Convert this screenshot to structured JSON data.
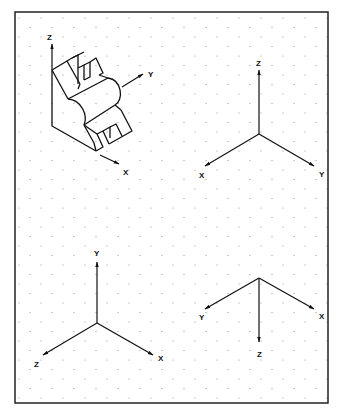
{
  "figure": {
    "frame": {
      "x": 15,
      "y": 12,
      "width": 313,
      "height": 391,
      "stroke": "#222222"
    },
    "grid": {
      "type": "isometric-dot",
      "dx": 11,
      "dy": 19,
      "color": "#888888"
    },
    "panels": [
      {
        "id": "object-view",
        "description": "Isometric sketch of bracket object with attached coordinate axes",
        "origin": [
          52,
          70
        ],
        "axes": [
          {
            "name": "Z",
            "label": "Z",
            "from": [
              52,
              70
            ],
            "to": [
              52,
              44
            ],
            "label_pos": [
              50,
              37
            ]
          },
          {
            "name": "Y",
            "label": "Y",
            "from": [
              122,
              87
            ],
            "to": [
              143,
              74
            ],
            "label_pos": [
              150,
              77
            ]
          },
          {
            "name": "X",
            "label": "X",
            "from": [
              100,
              155
            ],
            "to": [
              119,
              164
            ],
            "label_pos": [
              125,
              175
            ]
          }
        ]
      },
      {
        "id": "axes-top-right",
        "origin": [
          259,
          134
        ],
        "axes": [
          {
            "name": "Z",
            "label": "Z",
            "from": [
              259,
              134
            ],
            "to": [
              259,
              70
            ],
            "label_pos": [
              259,
              65
            ]
          },
          {
            "name": "X",
            "label": "X",
            "from": [
              259,
              134
            ],
            "to": [
              205,
              166
            ],
            "label_pos": [
              201,
              178
            ]
          },
          {
            "name": "Y",
            "label": "Y",
            "from": [
              259,
              134
            ],
            "to": [
              314,
              166
            ],
            "label_pos": [
              322,
              177
            ]
          }
        ]
      },
      {
        "id": "axes-bottom-left",
        "origin": [
          97,
          323
        ],
        "axes": [
          {
            "name": "Y",
            "label": "Y",
            "from": [
              97,
              323
            ],
            "to": [
              97,
              262
            ],
            "label_pos": [
              97,
              255
            ]
          },
          {
            "name": "Z",
            "label": "Z",
            "from": [
              97,
              323
            ],
            "to": [
              43,
              355
            ],
            "label_pos": [
              37,
              367
            ]
          },
          {
            "name": "X",
            "label": "X",
            "from": [
              97,
              323
            ],
            "to": [
              153,
              355
            ],
            "label_pos": [
              161,
              361
            ]
          }
        ]
      },
      {
        "id": "axes-bottom-right",
        "origin": [
          259,
          278
        ],
        "axes": [
          {
            "name": "Y",
            "label": "Y",
            "from": [
              259,
              278
            ],
            "to": [
              205,
              309
            ],
            "label_pos": [
              201,
              320
            ]
          },
          {
            "name": "X",
            "label": "X",
            "from": [
              259,
              278
            ],
            "to": [
              314,
              309
            ],
            "label_pos": [
              322,
              319
            ]
          },
          {
            "name": "Z",
            "label": "Z",
            "from": [
              259,
              278
            ],
            "to": [
              259,
              342
            ],
            "label_pos": [
              260,
              357
            ]
          }
        ]
      }
    ]
  },
  "labels": {
    "obj_z": "Z",
    "obj_y": "Y",
    "obj_x": "X",
    "tr_z": "Z",
    "tr_x": "X",
    "tr_y": "Y",
    "bl_y": "Y",
    "bl_z": "Z",
    "bl_x": "X",
    "br_y": "Y",
    "br_x": "X",
    "br_z": "Z"
  }
}
